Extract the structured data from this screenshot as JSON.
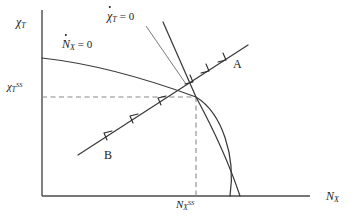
{
  "figure": {
    "type": "phase-diagram",
    "background_color": "#ffffff",
    "line_color": "#3a3a3a",
    "axis_color": "#4a4a4a",
    "text_color": "#1a1a1a"
  },
  "axes": {
    "y_label": "χ",
    "y_label_sub": "T",
    "x_label": "N",
    "x_label_sub": "X",
    "origin_x": 42,
    "origin_y": 196,
    "x_end": 310,
    "y_top": 10
  },
  "ticks": {
    "y_steady_state": {
      "symbol": "χ",
      "sub": "T",
      "sup": "SS",
      "value_y": 97
    },
    "x_steady_state": {
      "symbol": "N",
      "sub": "X",
      "sup": "SS",
      "value_x": 196
    }
  },
  "curves": {
    "n_nullcline": {
      "label_symbol": "N",
      "label_sub": "X",
      "label_eq": "= 0",
      "has_dot_accent": true,
      "path": "M 42 58 C 96 64, 150 80, 196 97 C 222 113, 236 156, 230 196"
    },
    "chi_nullcline": {
      "label_symbol": "χ",
      "label_sub": "T",
      "label_eq": "= 0",
      "has_dot_accent": true,
      "path": "M 163 22 L 196 97 C 216 134, 232 172, 240 196"
    },
    "saddle_path": {
      "label_a": "A",
      "label_b": "B",
      "start_x": 78,
      "start_y": 155,
      "end_x": 248,
      "end_y": 45,
      "arrow_direction": "toward-steady-state"
    }
  },
  "annotations": {
    "pointer_chi_label_line": "M 146 26 L 188 86",
    "dashed_horizontal": "M 42 97 L 196 97",
    "dashed_vertical": "M 196 97 L 196 196"
  }
}
